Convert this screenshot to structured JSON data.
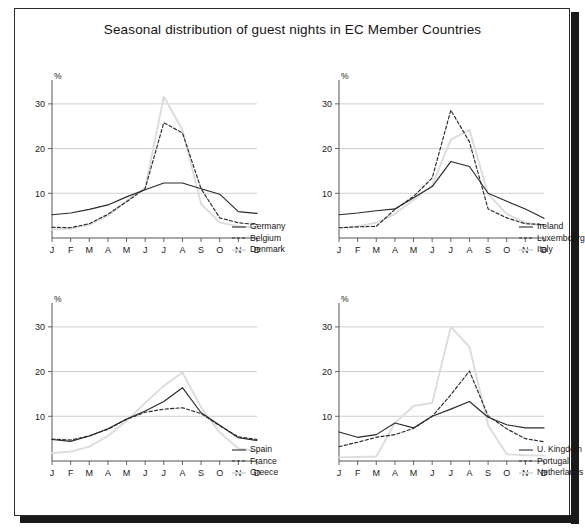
{
  "figure": {
    "title": "Seasonal distribution of guest nights in EC Member Countries",
    "background_color": "#ffffff",
    "frame_color": "#2b2b2b",
    "shadow_color": "#1a1a1a"
  },
  "axes": {
    "y_unit_label": "%",
    "y_ticks": [
      10,
      20,
      30
    ],
    "y_min": 0,
    "y_max": 34,
    "x_ticks": [
      "J",
      "F",
      "M",
      "A",
      "M",
      "J",
      "J",
      "A",
      "S",
      "O",
      "N",
      "D"
    ],
    "gridline_color": "#c9c9c9",
    "axis_color": "#555555"
  },
  "styles": {
    "solid_color": "#2a2a2a",
    "dashed_color": "#2a2a2a",
    "light_color": "#dcdcdc"
  },
  "chart_data": [
    {
      "type": "line",
      "panel": "top-left",
      "title": "",
      "xlabel": "",
      "ylabel": "%",
      "categories": [
        "J",
        "F",
        "M",
        "A",
        "M",
        "J",
        "J",
        "A",
        "S",
        "O",
        "N",
        "D"
      ],
      "ylim": [
        0,
        34
      ],
      "yticks": [
        10,
        20,
        30
      ],
      "grid": true,
      "legend_position": "right",
      "series": [
        {
          "name": "Germany",
          "style": "solid",
          "color": "#2a2a2a",
          "values": [
            5.2,
            5.6,
            6.4,
            7.4,
            9.2,
            10.8,
            12.3,
            12.3,
            11.0,
            9.8,
            5.9,
            5.5
          ]
        },
        {
          "name": "Belgium",
          "style": "dashed",
          "color": "#2a2a2a",
          "values": [
            2.4,
            2.3,
            3.2,
            5.3,
            8.1,
            11.1,
            25.8,
            23.5,
            11.0,
            4.5,
            3.4,
            3.0
          ]
        },
        {
          "name": "Denmark",
          "style": "light",
          "color": "#dcdcdc",
          "values": [
            1.9,
            2.1,
            3.0,
            5.0,
            8.3,
            11.2,
            31.6,
            24.2,
            7.6,
            3.5,
            2.6,
            2.3
          ]
        }
      ]
    },
    {
      "type": "line",
      "panel": "top-right",
      "title": "",
      "xlabel": "",
      "ylabel": "%",
      "categories": [
        "J",
        "F",
        "M",
        "A",
        "M",
        "J",
        "J",
        "A",
        "S",
        "O",
        "N",
        "D"
      ],
      "ylim": [
        0,
        34
      ],
      "yticks": [
        10,
        20,
        30
      ],
      "grid": true,
      "legend_position": "right",
      "series": [
        {
          "name": "Ireland",
          "style": "solid",
          "color": "#2a2a2a",
          "values": [
            5.2,
            5.6,
            6.1,
            6.5,
            9.0,
            11.5,
            17.1,
            16.0,
            10.0,
            8.2,
            6.5,
            4.4
          ]
        },
        {
          "name": "Luxembourg",
          "style": "dashed",
          "color": "#2a2a2a",
          "values": [
            2.3,
            2.5,
            2.6,
            6.4,
            9.3,
            13.4,
            28.6,
            21.5,
            6.5,
            4.5,
            3.2,
            3.0
          ]
        },
        {
          "name": "Italy",
          "style": "light",
          "color": "#dcdcdc",
          "values": [
            2.2,
            2.6,
            3.4,
            5.4,
            8.5,
            11.8,
            22.0,
            24.2,
            9.8,
            5.4,
            3.4,
            2.8
          ]
        }
      ]
    },
    {
      "type": "line",
      "panel": "bottom-left",
      "title": "",
      "xlabel": "",
      "ylabel": "%",
      "categories": [
        "J",
        "F",
        "M",
        "A",
        "M",
        "J",
        "J",
        "A",
        "S",
        "O",
        "N",
        "D"
      ],
      "ylim": [
        0,
        34
      ],
      "yticks": [
        10,
        20,
        30
      ],
      "grid": true,
      "legend_position": "right",
      "series": [
        {
          "name": "Spain",
          "style": "solid",
          "color": "#2a2a2a",
          "values": [
            4.8,
            4.4,
            5.6,
            7.2,
            9.4,
            11.2,
            13.3,
            16.4,
            10.8,
            8.0,
            5.2,
            4.6
          ]
        },
        {
          "name": "France",
          "style": "dashed",
          "color": "#2a2a2a",
          "values": [
            4.9,
            4.7,
            5.6,
            7.1,
            9.3,
            10.9,
            11.6,
            11.9,
            10.6,
            7.9,
            5.4,
            4.8
          ]
        },
        {
          "name": "Greece",
          "style": "light",
          "color": "#dcdcdc",
          "values": [
            1.8,
            2.1,
            3.2,
            5.6,
            9.0,
            13.0,
            16.8,
            19.8,
            12.0,
            6.4,
            2.8,
            2.2
          ]
        }
      ]
    },
    {
      "type": "line",
      "panel": "bottom-right",
      "title": "",
      "xlabel": "",
      "ylabel": "%",
      "categories": [
        "J",
        "F",
        "M",
        "A",
        "M",
        "J",
        "J",
        "A",
        "S",
        "O",
        "N",
        "D"
      ],
      "ylim": [
        0,
        34
      ],
      "yticks": [
        10,
        20,
        30
      ],
      "grid": true,
      "legend_position": "right",
      "series": [
        {
          "name": "U. Kingdom",
          "style": "solid",
          "color": "#2a2a2a",
          "values": [
            6.5,
            5.3,
            5.9,
            8.5,
            7.4,
            10.0,
            11.6,
            13.3,
            9.8,
            8.1,
            7.4,
            7.4
          ]
        },
        {
          "name": "Portugal",
          "style": "dashed",
          "color": "#2a2a2a",
          "values": [
            3.2,
            4.2,
            5.3,
            5.9,
            7.3,
            10.0,
            14.8,
            20.1,
            10.1,
            7.2,
            5.0,
            4.3
          ]
        },
        {
          "name": "Netherlands",
          "style": "light",
          "color": "#dcdcdc",
          "values": [
            0.8,
            0.9,
            1.0,
            8.5,
            12.3,
            13.0,
            30.0,
            25.5,
            8.0,
            1.5,
            1.3,
            1.2
          ]
        }
      ]
    }
  ],
  "legends": [
    {
      "panel": "top-left",
      "items": [
        "Germany",
        "Belgium",
        "Denmark"
      ]
    },
    {
      "panel": "top-right",
      "items": [
        "Ireland",
        "Luxembourg",
        "Italy"
      ]
    },
    {
      "panel": "bottom-left",
      "items": [
        "Spain",
        "France",
        "Greece"
      ]
    },
    {
      "panel": "bottom-right",
      "items": [
        "U. Kingdom",
        "Portugal",
        "Netherlands"
      ]
    }
  ]
}
